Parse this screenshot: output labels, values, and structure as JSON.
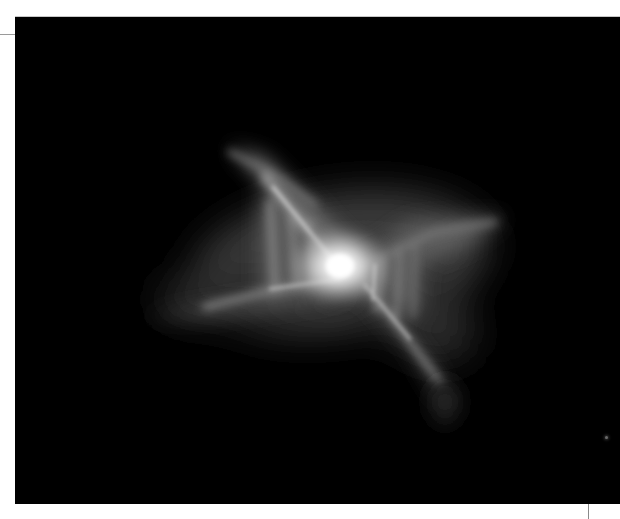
{
  "image": {
    "alt": "Grayscale telescope image of an X-shaped bipolar nebula with a bright central star on a black background",
    "subject": "bipolar-nebula",
    "colors": {
      "background": "#000000",
      "page": "#ffffff",
      "core": "#ffffff",
      "nebula": "#9a9a9a",
      "crop_mark": "#9a9a9a"
    },
    "frame": {
      "x": 15,
      "y": 17,
      "width": 605,
      "height": 487
    },
    "core_position": {
      "x": 340,
      "y": 262
    },
    "stars": [
      {
        "x": 606,
        "y": 437
      }
    ]
  }
}
